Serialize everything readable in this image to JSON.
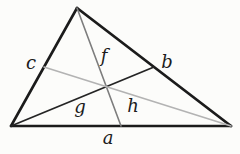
{
  "diagram": {
    "background": "#fcfcfa",
    "ink": "#1b1b1b",
    "width": 240,
    "height": 154,
    "points": {
      "apex": {
        "x": 77,
        "y": 8
      },
      "bottom_left": {
        "x": 11,
        "y": 126
      },
      "bottom_right": {
        "x": 231,
        "y": 126
      },
      "midpoint_bottom": {
        "x": 121,
        "y": 126
      },
      "midpoint_right_side": {
        "x": 154,
        "y": 67
      },
      "midpoint_left_side": {
        "x": 44,
        "y": 67
      }
    },
    "lines": [
      {
        "name": "triangle-edge-left",
        "from": "apex",
        "to": "bottom_left",
        "color": "#1b1b1b",
        "width": 2.6
      },
      {
        "name": "triangle-edge-right",
        "from": "apex",
        "to": "bottom_right",
        "color": "#1b1b1b",
        "width": 2.8
      },
      {
        "name": "triangle-edge-bottom",
        "from": "bottom_left",
        "to": "bottom_right",
        "color": "#1b1b1b",
        "width": 2.6
      },
      {
        "name": "median-from-bottom-left",
        "from": "bottom_left",
        "to": "midpoint_right_side",
        "color": "#242424",
        "width": 1.8
      },
      {
        "name": "median-from-apex",
        "from": "apex",
        "to": "midpoint_bottom",
        "color": "#7d7d7d",
        "width": 1.6
      },
      {
        "name": "median-from-bottom-right",
        "from": "midpoint_left_side",
        "to": "bottom_right",
        "color": "#b3b3b3",
        "width": 1.6
      }
    ],
    "labels": [
      {
        "name": "label-c",
        "text": "c",
        "x": 31,
        "y": 62
      },
      {
        "name": "label-f",
        "text": "f",
        "x": 104,
        "y": 55
      },
      {
        "name": "label-b",
        "text": "b",
        "x": 167,
        "y": 61
      },
      {
        "name": "label-g",
        "text": "g",
        "x": 80,
        "y": 106
      },
      {
        "name": "label-h",
        "text": "h",
        "x": 133,
        "y": 105
      },
      {
        "name": "label-a",
        "text": "a",
        "x": 108,
        "y": 137
      }
    ],
    "label_color": "#1b1b1b",
    "label_font_size": 18
  }
}
